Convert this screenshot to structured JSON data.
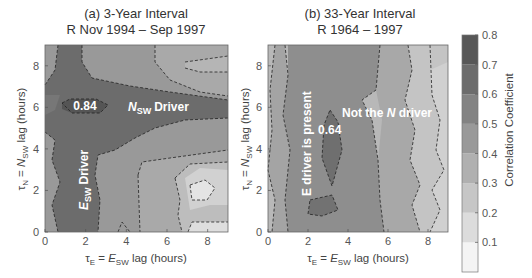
{
  "chart_data": [
    {
      "type": "heatmap",
      "subtype": "filled-contour",
      "title": "(a) 3-Year Interval",
      "subtitle": "R Nov 1994 – Sep 1997",
      "xlabel": "τE = ESW lag (hours)",
      "ylabel": "τN = NSW lag (hours)",
      "xlim": [
        0,
        9
      ],
      "ylim": [
        0,
        9
      ],
      "xticks": [
        "0",
        "2",
        "4",
        "6",
        "8"
      ],
      "yticks": [
        "0",
        "2",
        "4",
        "6",
        "8"
      ],
      "annotations": [
        {
          "text": "0.84",
          "x": 1.8,
          "y": 6.0
        },
        {
          "text": "NSW Driver",
          "x": 5.3,
          "y": 6.0
        },
        {
          "text": "ESW Driver",
          "x": 2.0,
          "y": 2.5,
          "rotation": "vertical"
        }
      ],
      "max_value": 0.84,
      "levels": [
        {
          "level": 0.8,
          "region": "small island around tauE 1-3, tauN 5.5-6.5"
        },
        {
          "level": 0.7,
          "region": "horizontal band tauN 4.5-7 plus vertical column tauE 0.5-2.5 from bottom to top"
        },
        {
          "level": 0.6,
          "region": "surrounds the cross-shaped maximum"
        },
        {
          "level": 0.5,
          "region": "middle areas"
        },
        {
          "level": 0.4,
          "region": "tauE 4-6 lower region"
        },
        {
          "level": 0.3,
          "region": "tauE 6-9 lower region"
        },
        {
          "level": 0.2,
          "region": "minimum near tauE 7-8, tauN 2"
        }
      ]
    },
    {
      "type": "heatmap",
      "subtype": "filled-contour",
      "title": "(b) 33-Year Interval",
      "subtitle": "R 1964 – 1997",
      "xlabel": "τE = ESW lag (hours)",
      "ylabel": "τN = NSW lag (hours)",
      "xlim": [
        0,
        9
      ],
      "ylim": [
        0,
        9
      ],
      "xticks": [
        "0",
        "2",
        "4",
        "6",
        "8"
      ],
      "yticks": [
        "0",
        "2",
        "4",
        "6",
        "8"
      ],
      "annotations": [
        {
          "text": "E driver is present",
          "x": 1.7,
          "y": 4.2,
          "rotation": "vertical"
        },
        {
          "text": "Not the N driver",
          "x": 6.3,
          "y": 6.0
        },
        {
          "text": "0.64",
          "x": 3.2,
          "y": 4.8
        }
      ],
      "max_value": 0.64,
      "levels": [
        {
          "level": 0.6,
          "region": "small islands at tauE ~3, tauN 2.5-6 and tauE 2-3, tauN 1"
        },
        {
          "level": 0.5,
          "region": "vertical band tauE 1-5.5"
        },
        {
          "level": 0.4,
          "region": "vertical bands tauE 0.5-1 and 5.5-7"
        },
        {
          "level": 0.3,
          "region": "tauE 7-8.5 and left edge"
        },
        {
          "level": 0.2,
          "region": "right edge tauE > 8.5"
        }
      ]
    }
  ],
  "colorbar": {
    "label": "Correlation Coefficient",
    "ticks": [
      "0.1",
      "0.2",
      "0.3",
      "0.4",
      "0.5",
      "0.6",
      "0.7",
      "0.8"
    ],
    "range": [
      0,
      0.8
    ],
    "colors": [
      "#f4f4f4",
      "#dcdcdc",
      "#c6c6c6",
      "#b0b0b0",
      "#999999",
      "#838383",
      "#6c6c6c",
      "#575757"
    ]
  },
  "labels": {
    "a_title": "(a) 3-Year Interval",
    "a_subtitle": "R Nov 1994 – Sep 1997",
    "b_title": "(b) 33-Year Interval",
    "b_subtitle": "R 1964 – 1997",
    "a_ann_max": "0.84",
    "a_ann_n": "Driver",
    "a_ann_n_sym": "N",
    "a_ann_n_sub": "SW",
    "a_ann_e": "Driver",
    "a_ann_e_sym": "E",
    "a_ann_e_sub": "SW",
    "b_ann_e": "E driver is present",
    "b_ann_n_pre": "Not the ",
    "b_ann_n_sym": "N",
    "b_ann_n_post": " driver",
    "b_ann_max": "0.64",
    "xlabel_tau": "τ",
    "xlabel_tau_sub": "E",
    "xlabel_eq": " = ",
    "xlabel_sym": "E",
    "xlabel_sym_sub": "SW",
    "xlabel_rest": " lag (hours)",
    "ylabel_tau": "τ",
    "ylabel_tau_sub": "N",
    "ylabel_eq": " = ",
    "ylabel_sym": "N",
    "ylabel_sym_sub": "SW",
    "ylabel_rest": " lag (hours)",
    "cbar_label": "Correlation Coefficient"
  }
}
